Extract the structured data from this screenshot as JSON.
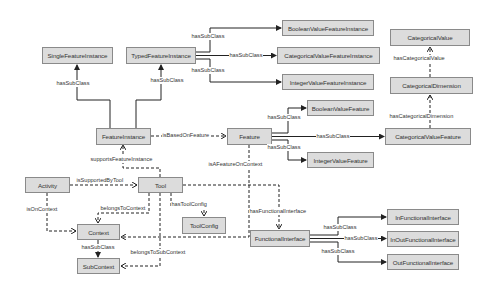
{
  "diagram": {
    "colors": {
      "node_fill": "#dcdcdc",
      "node_border": "#8a8a8a",
      "edge": "#222222",
      "background": "#ffffff"
    },
    "nodes": {
      "single_feature_instance": "SingleFeatureInstance",
      "typed_feature_instance": "TypedFeatureInstance",
      "boolean_value_feature_instance": "BooleanValueFeatureInstance",
      "categorical_value_feature_instance": "CategoricalValueFeatureInstance",
      "integer_value_feature_instance": "IntegerValueFeatureInstance",
      "categorical_value": "CategoricalValue",
      "categorical_dimension": "CategoricalDimension",
      "feature_instance": "FeatureInstance",
      "feature": "Feature",
      "boolean_value_feature": "BooleanValueFeature",
      "categorical_value_feature": "CategoricalValueFeature",
      "integer_value_feature": "IntegerValueFeature",
      "activity": "Activity",
      "tool": "Tool",
      "tool_config": "ToolConfig",
      "context": "Context",
      "sub_context": "SubContext",
      "functional_interface": "FunctionalInterface",
      "in_functional_interface": "InFunctionalInterface",
      "in_out_functional_interface": "InOutFunctionalInterface",
      "out_functional_interface": "OutFunctionalInterface"
    },
    "edge_labels": {
      "fi_single": "hasSubClass",
      "fi_typed": "hasSubClass",
      "typed_bool": "hasSubClass",
      "typed_cat": "hasSubClass",
      "typed_int": "hasSubClass",
      "is_based_on_feature": "isBasedOnFeature",
      "feat_bool": "hasSubClass",
      "feat_cat": "hasSubClass",
      "feat_int": "hasSubClass",
      "has_categorical_value": "hasCategoricalValue",
      "has_categorical_dimension": "hasCategoricalDimension",
      "supports_feature_instance": "supportsFeatureInstance",
      "is_a_feature_on_context": "isAFeatureOnContext",
      "is_supported_by_tool": "isSupportedByTool",
      "is_on_context": "isOnContext",
      "belongs_to_context": "belongsToContext",
      "has_tool_config": "hasToolConfig",
      "context_sub": "hasSubClass",
      "belongs_to_sub_context": "belongsToSubContext",
      "has_functional_interface": "hasFunctionalInterface",
      "fint_in": "hasSubClass",
      "fint_inout": "hasSubClass",
      "fint_out": "hasSubClass"
    }
  }
}
